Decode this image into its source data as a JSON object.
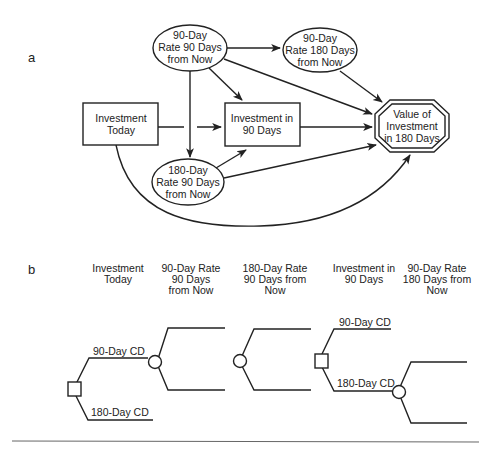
{
  "panel_a": {
    "label": "a",
    "nodes": {
      "rate90_now90": [
        "90-Day",
        "Rate 90 Days",
        "from Now"
      ],
      "rate90_now180": [
        "90-Day",
        "Rate 180 Days",
        "from Now"
      ],
      "investment_today": [
        "Investment",
        "Today"
      ],
      "investment_90": [
        "Investment in",
        "90 Days"
      ],
      "value_180": [
        "Value of",
        "Investment",
        "in 180 Days"
      ],
      "rate180_now90": [
        "180-Day",
        "Rate 90 Days",
        "from Now"
      ]
    }
  },
  "panel_b": {
    "label": "b",
    "headers": [
      [
        "Investment",
        "Today"
      ],
      [
        "90-Day Rate",
        "90 Days",
        "from Now"
      ],
      [
        "180-Day Rate",
        "90 Days from",
        "Now"
      ],
      [
        "Investment in",
        "90 Days"
      ],
      [
        "90-Day Rate",
        "180 Days from",
        "Now"
      ]
    ],
    "branch_labels": {
      "first_upper": "90-Day CD",
      "first_lower": "180-Day CD",
      "second_upper": "90-Day CD",
      "second_lower": "180-Day CD"
    }
  }
}
